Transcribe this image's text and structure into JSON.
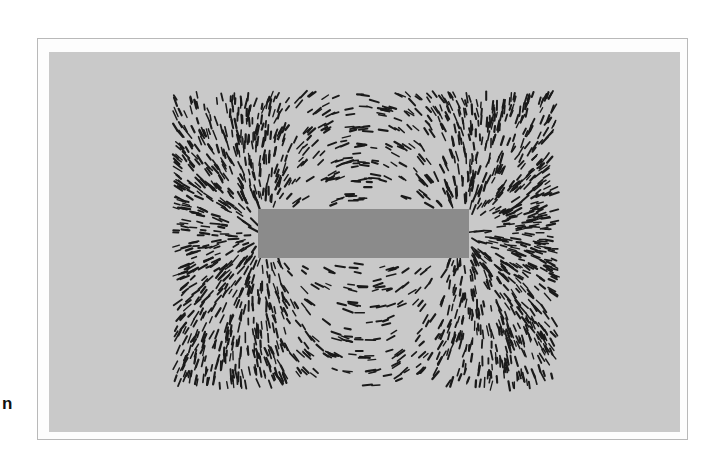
{
  "figure": {
    "edge_letter": "n",
    "colors": {
      "page_background": "#ffffff",
      "frame_border": "#b9b9b9",
      "panel_background": "#c9c9c9",
      "magnet_fill": "#8b8b8b",
      "filings": "#1a1a1a"
    },
    "magnet": {
      "x": 258,
      "y": 209,
      "width": 211,
      "height": 49
    },
    "filings_region": {
      "x_min": 175,
      "x_max": 556,
      "y_min": 94,
      "y_max": 386
    }
  }
}
